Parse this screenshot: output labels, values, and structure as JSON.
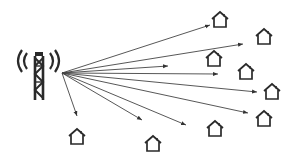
{
  "diagram": {
    "title": "",
    "colors": {
      "stroke": "#2a2a2a",
      "arrow": "#444444",
      "background": "#ffffff"
    },
    "tower": {
      "icon": "cell-tower-icon",
      "x": 10,
      "y": 44,
      "origin": [
        62,
        73
      ]
    },
    "houses": [
      {
        "id": "house-1",
        "x": 211,
        "y": 11
      },
      {
        "id": "house-2",
        "x": 255,
        "y": 28
      },
      {
        "id": "house-3",
        "x": 205,
        "y": 50
      },
      {
        "id": "house-4",
        "x": 237,
        "y": 63
      },
      {
        "id": "house-5",
        "x": 263,
        "y": 83
      },
      {
        "id": "house-6",
        "x": 255,
        "y": 110
      },
      {
        "id": "house-7",
        "x": 206,
        "y": 120
      },
      {
        "id": "house-8",
        "x": 144,
        "y": 135
      },
      {
        "id": "house-9",
        "x": 68,
        "y": 128
      }
    ],
    "arrows": [
      {
        "to": [
          210,
          25
        ]
      },
      {
        "to": [
          243,
          44
        ]
      },
      {
        "to": [
          168,
          66
        ]
      },
      {
        "to": [
          218,
          74
        ]
      },
      {
        "to": [
          257,
          92
        ]
      },
      {
        "to": [
          248,
          113
        ]
      },
      {
        "to": [
          186,
          125
        ]
      },
      {
        "to": [
          142,
          120
        ]
      },
      {
        "to": [
          77,
          116
        ]
      }
    ]
  }
}
